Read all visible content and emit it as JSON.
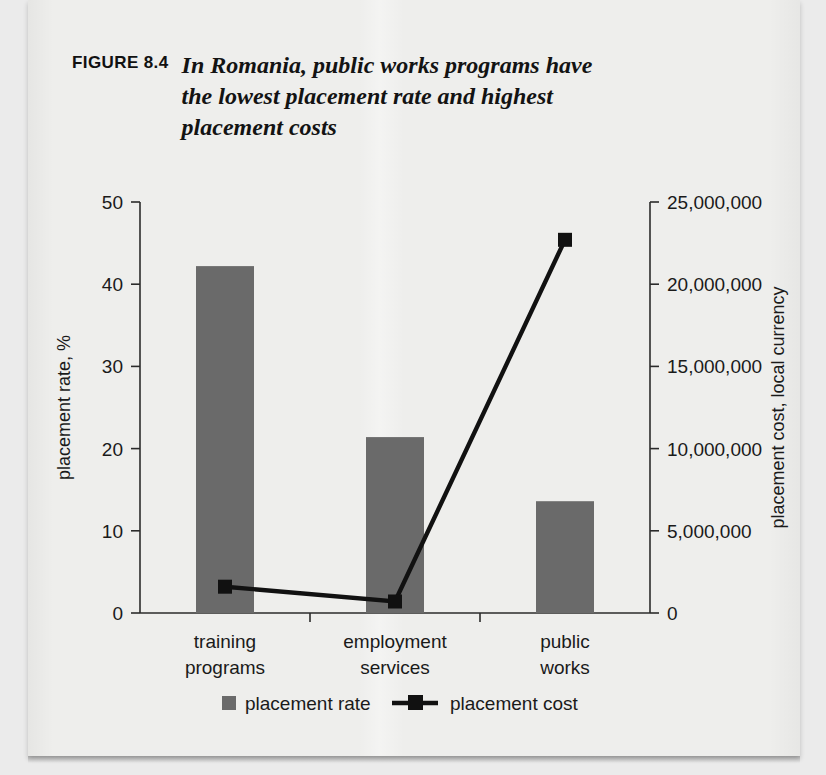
{
  "figure": {
    "label": "FIGURE 8.4",
    "title": "In Romania, public works programs have the lowest placement rate and highest placement costs"
  },
  "chart_data": {
    "type": "bar",
    "title": "In Romania, public works programs have the lowest placement rate and highest placement costs",
    "categories": [
      "training programs",
      "employment services",
      "public works"
    ],
    "category_lines": [
      [
        "training",
        "programs"
      ],
      [
        "employment",
        "services"
      ],
      [
        "public",
        "works"
      ]
    ],
    "series": [
      {
        "name": "placement rate",
        "type": "bar",
        "axis": "left",
        "values": [
          42.2,
          21.4,
          13.6
        ],
        "color": "#6a6a6a"
      },
      {
        "name": "placement cost",
        "type": "line",
        "axis": "right",
        "values": [
          1600000,
          700000,
          22700000
        ],
        "color": "#111111"
      }
    ],
    "xlabel": "",
    "ylabel": "placement rate, %",
    "y2label": "placement cost, local currency",
    "ylim": [
      0,
      50
    ],
    "y2lim": [
      0,
      25000000
    ],
    "yticks": [
      "0",
      "10",
      "20",
      "30",
      "40",
      "50"
    ],
    "ytick_values": [
      0,
      10,
      20,
      30,
      40,
      50
    ],
    "y2ticks": [
      "0",
      "5,000,000",
      "10,000,000",
      "15,000,000",
      "20,000,000",
      "25,000,000"
    ],
    "y2tick_values": [
      0,
      5000000,
      10000000,
      15000000,
      20000000,
      25000000
    ],
    "grid": false,
    "legend": {
      "position": "bottom",
      "entries": [
        {
          "label": "placement rate",
          "marker": "square",
          "color": "#6a6a6a"
        },
        {
          "label": "placement cost",
          "marker": "line-square",
          "color": "#111111"
        }
      ]
    }
  }
}
